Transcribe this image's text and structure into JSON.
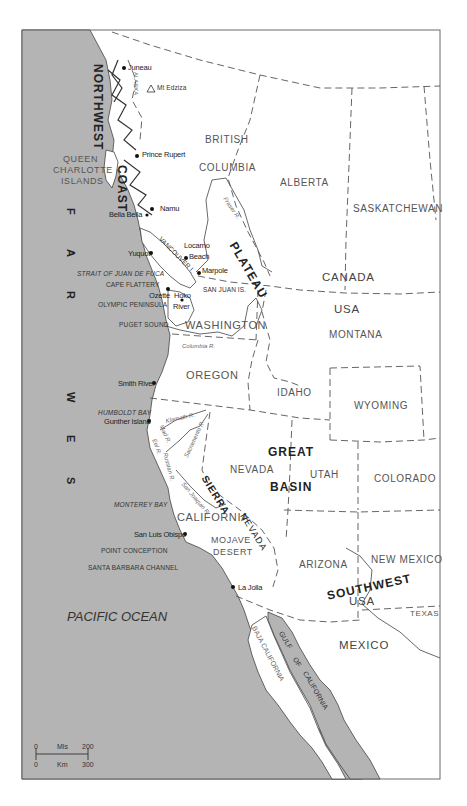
{
  "map": {
    "colors": {
      "water": "#b4b4b4",
      "land": "#ffffff",
      "border": "#555555",
      "frame": "#6a6a6a"
    },
    "frame": {
      "x": 22,
      "y": 30,
      "width": 418,
      "height": 749
    },
    "ocean_label": "PACIFIC OCEAN",
    "far_west_letters": [
      "F",
      "A",
      "R",
      "W",
      "E",
      "S",
      "T"
    ],
    "regions": {
      "northwest_coast_1": "NORTHWEST",
      "northwest_coast_2": "COAST",
      "plateau": "PLATEAU",
      "great_basin_1": "GREAT",
      "great_basin_2": "BASIN",
      "southwest": "SOUTHWEST"
    },
    "countries": {
      "canada": "CANADA",
      "usa_north": "USA",
      "usa_south": "USA",
      "mexico": "MEXICO"
    },
    "provinces_states": {
      "british_1": "BRITISH",
      "british_2": "COLUMBIA",
      "alberta": "ALBERTA",
      "saskatchewan": "SASKATCHEWAN",
      "washington": "WASHINGTON",
      "oregon": "OREGON",
      "idaho": "IDAHO",
      "montana": "MONTANA",
      "wyoming": "WYOMING",
      "nevada": "NEVADA",
      "utah": "UTAH",
      "colorado": "COLORADO",
      "california": "CALIFORNIA",
      "arizona": "ARIZONA",
      "new_mexico": "NEW MEXICO",
      "texas": "TEXAS",
      "alaska": "ALASKA",
      "baja_california": "BAJA CALIFORNIA"
    },
    "physical": {
      "queen_charlotte_1": "QUEEN",
      "queen_charlotte_2": "CHARLOTTE",
      "queen_charlotte_3": "ISLANDS",
      "vancouver_island": "VANCOUVER I.",
      "san_juan_is": "SAN JUAN IS.",
      "cape_flattery": "CAPE FLATTERY",
      "olympic_peninsula": "OLYMPIC PENINSULA",
      "point_conception": "POINT CONCEPTION",
      "sierra": "SIERRA",
      "nevada_range": "NEVADA",
      "mojave_1": "MOJAVE",
      "mojave_2": "DESERT",
      "mt_edziza": "Mt Edziza"
    },
    "water_bodies": {
      "strait_juan_de_fuca": "STRAIT OF JUAN DE FUCA",
      "puget_sound": "PUGET SOUND",
      "humboldt_bay": "HUMBOLDT BAY",
      "monterey_bay": "MONTEREY BAY",
      "santa_barbara_channel": "SANTA BARBARA CHANNEL",
      "gulf_1": "GULF",
      "gulf_2": "OF",
      "gulf_3": "CALIFORNIA"
    },
    "rivers": {
      "fraser": "Fraser R.",
      "columbia": "Columbia R.",
      "klamath": "Klamath R.",
      "mad": "Mad R.",
      "eel": "Eel R.",
      "russian": "Russian R.",
      "sacramento": "Sacramento R.",
      "san_joaquin": "San Joaquin R."
    },
    "sites": [
      {
        "name": "Juneau",
        "x": 124,
        "y": 68
      },
      {
        "name": "Prince Rupert",
        "x": 137,
        "y": 156
      },
      {
        "name": "Namu",
        "x": 152,
        "y": 209
      },
      {
        "name": "Bella Bella",
        "x": 0,
        "y": 0
      },
      {
        "name": "Locarno",
        "x": 0,
        "y": 0
      },
      {
        "name": "Beach",
        "x": 0,
        "y": 0
      },
      {
        "name": "Yuquot",
        "x": 151,
        "y": 253
      },
      {
        "name": "Marpole",
        "x": 199,
        "y": 273
      },
      {
        "name": "Ozette",
        "x": 169,
        "y": 289
      },
      {
        "name": "Hoko",
        "x": 0,
        "y": 0
      },
      {
        "name": "River",
        "x": 0,
        "y": 0
      },
      {
        "name": "Smith River",
        "x": 154,
        "y": 383
      },
      {
        "name": "Gunther Island",
        "x": 149,
        "y": 421
      },
      {
        "name": "San Luis Obispo",
        "x": 185,
        "y": 534
      },
      {
        "name": "La Jolla",
        "x": 233,
        "y": 587
      }
    ],
    "scale_bar": {
      "miles_start": "0",
      "miles_label": "Mls",
      "miles_end": "200",
      "km_start": "0",
      "km_label": "Km",
      "km_end": "300"
    }
  }
}
